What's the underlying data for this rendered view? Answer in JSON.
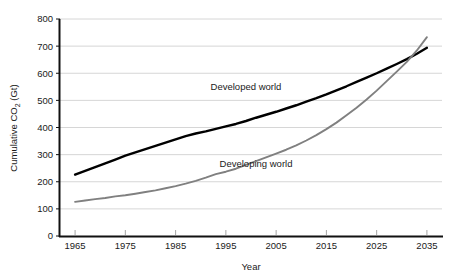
{
  "chart_data": {
    "type": "line",
    "title": "",
    "xlabel": "Year",
    "ylabel_parts": {
      "pre": "Cumulative CO",
      "sub": "2",
      "post": " (Gt)"
    },
    "ylabel": "Cumulative CO2 (Gt)",
    "xlim": [
      1962,
      2038
    ],
    "ylim": [
      0,
      800
    ],
    "xticks": [
      1965,
      1975,
      1985,
      1995,
      2005,
      2015,
      2025,
      2035
    ],
    "xtick_labels": [
      "1965",
      "1975",
      "1985",
      "1995",
      "2005",
      "2015",
      "2025",
      "2035"
    ],
    "yticks": [
      0,
      100,
      200,
      300,
      400,
      500,
      600,
      700,
      800
    ],
    "ytick_labels": [
      "0",
      "100",
      "200",
      "300",
      "400",
      "500",
      "600",
      "700",
      "800"
    ],
    "grid": {
      "horizontal": true,
      "vertical": false,
      "color": "#cccccc"
    },
    "legend": {
      "position": "inline-annotations"
    },
    "x": [
      1965,
      1967,
      1969,
      1971,
      1973,
      1975,
      1977,
      1979,
      1981,
      1983,
      1985,
      1987,
      1989,
      1991,
      1993,
      1995,
      1997,
      1999,
      2001,
      2003,
      2005,
      2007,
      2009,
      2011,
      2013,
      2015,
      2017,
      2019,
      2021,
      2023,
      2025,
      2027,
      2029,
      2031,
      2033,
      2035
    ],
    "series": [
      {
        "name": "Developed world",
        "color": "#000000",
        "label_x": 1999,
        "label_y": 540,
        "values": [
          226,
          240,
          254,
          268,
          282,
          296,
          308,
          320,
          332,
          344,
          356,
          368,
          378,
          386,
          395,
          404,
          413,
          424,
          436,
          447,
          458,
          470,
          482,
          495,
          508,
          522,
          537,
          552,
          568,
          584,
          600,
          617,
          634,
          652,
          672,
          694
        ]
      },
      {
        "name": "Developing world",
        "color": "#808080",
        "label_x": 2001,
        "label_y": 255,
        "values": [
          126,
          131,
          136,
          140,
          146,
          150,
          156,
          162,
          168,
          176,
          184,
          193,
          203,
          215,
          228,
          237,
          248,
          262,
          276,
          290,
          304,
          318,
          334,
          352,
          372,
          394,
          418,
          445,
          473,
          503,
          536,
          571,
          606,
          642,
          684,
          733
        ]
      }
    ],
    "crossover": {
      "x": 2031,
      "y": 655
    }
  }
}
